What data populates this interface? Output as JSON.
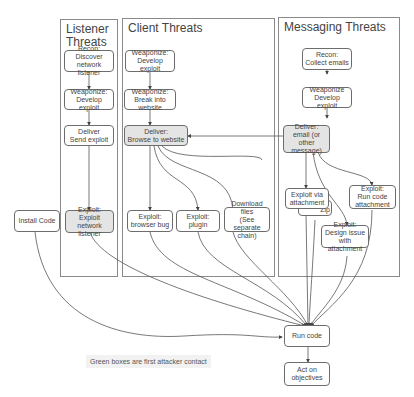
{
  "colors": {
    "first_contact_fill": "#e4e4e4",
    "normal_fill": "#ffffff",
    "border": "#6d6d6d",
    "edge": "#555555"
  },
  "panels": {
    "listener": {
      "title": "Listener\nThreats"
    },
    "client": {
      "title": "Client Threats"
    },
    "messaging": {
      "title": "Messaging Threats"
    }
  },
  "nodes": {
    "l_recon": "Recon:\nDiscover network\nlistener",
    "l_weaponize": "Weaponize:\nDevelop exploit",
    "l_deliver": "Deliver\nSend exploit",
    "l_exploit": "Exploit:\nExploit network\nlistener",
    "c_weaponize1": "Weaponize:\nDevelop exploit",
    "c_weaponize2": "Weaponize:\nBreak into website",
    "c_deliver": "Deliver:\nBrowse to website",
    "c_exploit_browser": "Exploit:\nbrowser bug",
    "c_exploit_plugin": "Exploit:\nplugin",
    "c_download": "Download files\n(See\nseparate chain)",
    "m_recon": "Recon:\nCollect emails",
    "m_weaponize": "Weaponize\nDevelop exploit",
    "m_deliver": "Deliver:\nemail (or\nother message)",
    "m_exploit_attach": "Exploit via\nattachment",
    "m_zip": "Zip",
    "m_exploit_design": "Exploit:\nDesign issue\nwith attachment",
    "m_exploit_runcode": "Exploit:\nRun code\nattachment",
    "install_code": "Install Code",
    "run_code": "Run code",
    "act": "Act on\nobjectives"
  },
  "legend": {
    "text": "Green boxes are first attacker contact"
  }
}
